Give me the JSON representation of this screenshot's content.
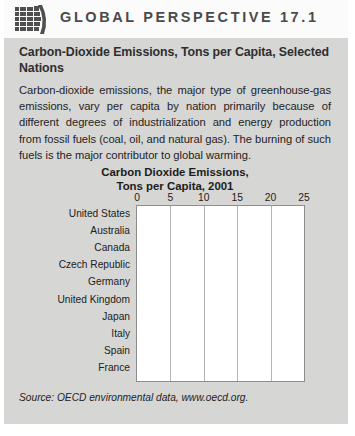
{
  "header": {
    "icon": "globe-grid-icon",
    "label": "GLOBAL PERSPECTIVE 17.1"
  },
  "box": {
    "title": "Carbon-Dioxide Emissions, Tons per Capita, Selected Nations",
    "body": "Carbon-dioxide emissions, the major type of greenhouse-gas emissions, vary per capita by nation primarily because of different degrees of industrialization and energy production from fossil fuels (coal, oil, and natural gas). The burning of such fuels is the major contributor to global warming.",
    "source": "Source: OECD environmental data, www.oecd.org."
  },
  "colors": {
    "panel_background": "#d6d6d4",
    "header_band": "#fbfbfb",
    "plot_background": "#ffffff",
    "plot_border": "#8d8d8d",
    "gridline": "#b4b4b4",
    "bar_dark": "#333333",
    "bar_medium": "#6e6e6e",
    "text": "#1c1c1c"
  },
  "chart_data": {
    "type": "bar",
    "orientation": "horizontal",
    "title": "Carbon Dioxide Emissions, Tons per Capita, 2001",
    "title_line1": "Carbon Dioxide Emissions,",
    "title_line2": "Tons per Capita, 2001",
    "xlabel": "",
    "ylabel": "",
    "xlim": [
      0,
      25
    ],
    "xticks": [
      0,
      5,
      10,
      15,
      20,
      25
    ],
    "xticklabels": [
      "0",
      "5",
      "10",
      "15",
      "20",
      "25"
    ],
    "grid": true,
    "legend": "none",
    "categories": [
      "United States",
      "Australia",
      "Canada",
      "Czech Republic",
      "Germany",
      "United Kingdom",
      "Japan",
      "Italy",
      "Spain",
      "France"
    ],
    "values": [
      19.2,
      16.3,
      15.5,
      11.6,
      10.2,
      9.4,
      9.2,
      7.6,
      6.9,
      6.6
    ],
    "bar_colors": [
      "#333333",
      "#6e6e6e",
      "#6e6e6e",
      "#333333",
      "#6e6e6e",
      "#6e6e6e",
      "#6e6e6e",
      "#282828",
      "#6e6e6e",
      "#333333"
    ]
  }
}
